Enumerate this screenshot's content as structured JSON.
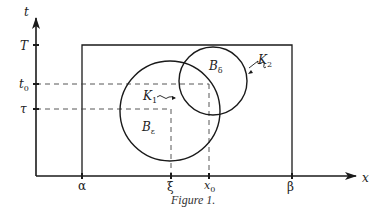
{
  "figure": {
    "caption": "Figure 1.",
    "axes": {
      "x_label": "x",
      "y_label": "t"
    },
    "y_ticks": [
      {
        "label": "T",
        "sub": ""
      },
      {
        "label": "t",
        "sub": "0"
      },
      {
        "label": "τ",
        "sub": ""
      }
    ],
    "x_ticks": [
      {
        "label": "α",
        "sub": ""
      },
      {
        "label": "ξ",
        "sub": ""
      },
      {
        "label": "x",
        "sub": "0"
      },
      {
        "label": "β",
        "sub": ""
      }
    ],
    "regions": {
      "big_ball": {
        "label": "B",
        "sub": "ε"
      },
      "small_ball": {
        "label": "B",
        "sub": "δ"
      },
      "k1": {
        "label": "K",
        "sub": "1"
      },
      "k2": {
        "label": "K",
        "sub": "2"
      }
    }
  },
  "colors": {
    "stroke": "#1a1a1a",
    "dashed": "#444444"
  }
}
